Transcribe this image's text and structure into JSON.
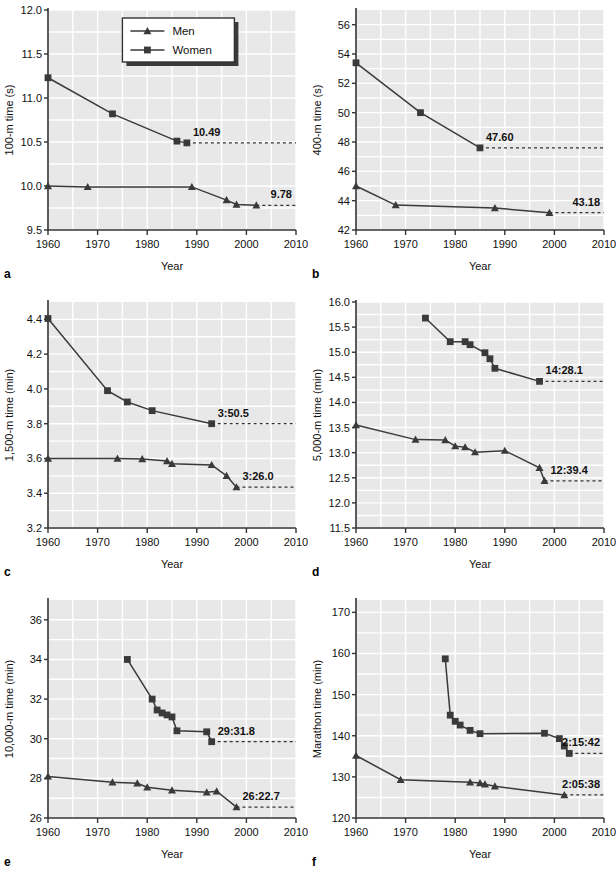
{
  "figure": {
    "panel_letters": [
      "a",
      "b",
      "c",
      "d",
      "e",
      "f"
    ],
    "legend": {
      "men_label": "Men",
      "women_label": "Women"
    },
    "xlabel": "Year",
    "xlim": [
      1960,
      2010
    ],
    "xticks": [
      1960,
      1970,
      1980,
      1990,
      2000,
      2010
    ],
    "colors": {
      "plot_bg": "#e8e8e8",
      "grid": "#ffffff",
      "axis": "#333333",
      "men": "#3a3a3a",
      "women": "#3a3a3a",
      "page_bg": "#ffffff"
    }
  },
  "chart_data": [
    {
      "type": "line",
      "panel": "a",
      "title": "",
      "xlabel": "Year",
      "ylabel": "100-m time (s)",
      "xlim": [
        1960,
        2010
      ],
      "ylim": [
        9.5,
        12.0
      ],
      "xticks": [
        1960,
        1970,
        1980,
        1990,
        2000,
        2010
      ],
      "yticks": [
        9.5,
        10.0,
        10.5,
        11.0,
        11.5,
        12.0
      ],
      "ytick_labels": [
        "9.5",
        "10.0",
        "10.5",
        "11.0",
        "11.5",
        "12.0"
      ],
      "grid": true,
      "legend": "top-center",
      "annotations": [
        {
          "text": "10.49",
          "x": 1988,
          "y": 10.49,
          "series": "Women"
        },
        {
          "text": "9.78",
          "x": 2002,
          "y": 9.78,
          "series": "Men"
        }
      ],
      "series": [
        {
          "name": "Men",
          "marker": "triangle",
          "x": [
            1960,
            1968,
            1989,
            1996,
            1998,
            2002
          ],
          "values": [
            10.0,
            9.99,
            9.99,
            9.84,
            9.79,
            9.78
          ]
        },
        {
          "name": "Women",
          "marker": "square",
          "x": [
            1960,
            1973,
            1986,
            1988
          ],
          "values": [
            11.23,
            10.82,
            10.51,
            10.49
          ]
        }
      ]
    },
    {
      "type": "line",
      "panel": "b",
      "title": "",
      "xlabel": "Year",
      "ylabel": "400-m time (s)",
      "xlim": [
        1960,
        2010
      ],
      "ylim": [
        42,
        57
      ],
      "xticks": [
        1960,
        1970,
        1980,
        1990,
        2000,
        2010
      ],
      "yticks": [
        42,
        44,
        46,
        48,
        50,
        52,
        54,
        56
      ],
      "ytick_labels": [
        "42",
        "44",
        "46",
        "48",
        "50",
        "52",
        "54",
        "56"
      ],
      "grid": true,
      "annotations": [
        {
          "text": "47.60",
          "x": 1985,
          "y": 47.6,
          "series": "Women"
        },
        {
          "text": "43.18",
          "x": 1999,
          "y": 43.18,
          "series": "Men"
        }
      ],
      "series": [
        {
          "name": "Men",
          "marker": "triangle",
          "x": [
            1960,
            1968,
            1988,
            1999
          ],
          "values": [
            45.0,
            43.7,
            43.5,
            43.18
          ]
        },
        {
          "name": "Women",
          "marker": "square",
          "x": [
            1960,
            1973,
            1985
          ],
          "values": [
            53.4,
            50.0,
            47.6
          ]
        }
      ]
    },
    {
      "type": "line",
      "panel": "c",
      "title": "",
      "xlabel": "Year",
      "ylabel": "1,500-m time (min)",
      "xlim": [
        1960,
        2010
      ],
      "ylim": [
        3.2,
        4.5
      ],
      "xticks": [
        1960,
        1970,
        1980,
        1990,
        2000,
        2010
      ],
      "yticks": [
        3.2,
        3.4,
        3.6,
        3.8,
        4.0,
        4.2,
        4.4
      ],
      "ytick_labels": [
        "3.2",
        "3.4",
        "3.6",
        "3.8",
        "4.0",
        "4.2",
        "4.4"
      ],
      "grid": true,
      "annotations": [
        {
          "text": "3:50.5",
          "x": 1993,
          "y": 3.8,
          "series": "Women"
        },
        {
          "text": "3:26.0",
          "x": 1998,
          "y": 3.435,
          "series": "Men"
        }
      ],
      "series": [
        {
          "name": "Men",
          "marker": "triangle",
          "x": [
            1960,
            1974,
            1979,
            1984,
            1985,
            1993,
            1996,
            1998
          ],
          "values": [
            3.6,
            3.6,
            3.597,
            3.585,
            3.57,
            3.563,
            3.5,
            3.435
          ]
        },
        {
          "name": "Women",
          "marker": "square",
          "x": [
            1960,
            1972,
            1976,
            1981,
            1993
          ],
          "values": [
            4.405,
            3.99,
            3.925,
            3.875,
            3.8
          ]
        }
      ]
    },
    {
      "type": "line",
      "panel": "d",
      "title": "",
      "xlabel": "Year",
      "ylabel": "5,000-m time (min)",
      "xlim": [
        1960,
        2010
      ],
      "ylim": [
        11.5,
        16.0
      ],
      "xticks": [
        1960,
        1970,
        1980,
        1990,
        2000,
        2010
      ],
      "yticks": [
        11.5,
        12.0,
        12.5,
        13.0,
        13.5,
        14.0,
        14.5,
        15.0,
        15.5,
        16.0
      ],
      "ytick_labels": [
        "11.5",
        "12.0",
        "12.5",
        "13.0",
        "13.5",
        "14.0",
        "14.5",
        "15.0",
        "15.5",
        "16.0"
      ],
      "grid": true,
      "annotations": [
        {
          "text": "14:28.1",
          "x": 1997,
          "y": 14.42,
          "series": "Women"
        },
        {
          "text": "12:39.4",
          "x": 1998,
          "y": 12.44,
          "series": "Men"
        }
      ],
      "series": [
        {
          "name": "Men",
          "marker": "triangle",
          "x": [
            1960,
            1972,
            1978,
            1980,
            1982,
            1984,
            1990,
            1997,
            1998
          ],
          "values": [
            13.55,
            13.26,
            13.25,
            13.13,
            13.11,
            13.01,
            13.04,
            12.7,
            12.44
          ]
        },
        {
          "name": "Women",
          "marker": "square",
          "x": [
            1974,
            1979,
            1982,
            1983,
            1986,
            1987,
            1988,
            1997
          ],
          "values": [
            15.68,
            15.21,
            15.21,
            15.15,
            14.99,
            14.87,
            14.68,
            14.42
          ]
        }
      ]
    },
    {
      "type": "line",
      "panel": "e",
      "title": "",
      "xlabel": "Year",
      "ylabel": "10,000-m time (min)",
      "xlim": [
        1960,
        2010
      ],
      "ylim": [
        26,
        37
      ],
      "xticks": [
        1960,
        1970,
        1980,
        1990,
        2000,
        2010
      ],
      "yticks": [
        26,
        28,
        30,
        32,
        34,
        36
      ],
      "ytick_labels": [
        "26",
        "28",
        "30",
        "32",
        "34",
        "36"
      ],
      "grid": true,
      "annotations": [
        {
          "text": "29:31.8",
          "x": 1993,
          "y": 29.85,
          "series": "Women"
        },
        {
          "text": "26:22.7",
          "x": 1998,
          "y": 26.55,
          "series": "Men"
        }
      ],
      "series": [
        {
          "name": "Men",
          "marker": "triangle",
          "x": [
            1960,
            1973,
            1978,
            1980,
            1985,
            1992,
            1994,
            1998
          ],
          "values": [
            28.1,
            27.8,
            27.75,
            27.55,
            27.4,
            27.3,
            27.35,
            26.55
          ]
        },
        {
          "name": "Women",
          "marker": "square",
          "x": [
            1976,
            1981,
            1982,
            1983,
            1984,
            1985,
            1986,
            1992,
            1993
          ],
          "values": [
            34.0,
            32.0,
            31.45,
            31.3,
            31.2,
            31.1,
            30.4,
            30.35,
            29.85
          ]
        }
      ]
    },
    {
      "type": "line",
      "panel": "f",
      "title": "",
      "xlabel": "Year",
      "ylabel": "Marathon time (min)",
      "xlim": [
        1960,
        2010
      ],
      "ylim": [
        120,
        173
      ],
      "xticks": [
        1960,
        1970,
        1980,
        1990,
        2000,
        2010
      ],
      "yticks": [
        120,
        130,
        140,
        150,
        160,
        170
      ],
      "ytick_labels": [
        "120",
        "130",
        "140",
        "150",
        "160",
        "170"
      ],
      "grid": true,
      "annotations": [
        {
          "text": "2:15:42",
          "x": 2003,
          "y": 135.7,
          "series": "Women"
        },
        {
          "text": "2:05:38",
          "x": 2002,
          "y": 125.6,
          "series": "Men"
        }
      ],
      "series": [
        {
          "name": "Men",
          "marker": "triangle",
          "x": [
            1960,
            1969,
            1983,
            1985,
            1986,
            1988,
            2002
          ],
          "values": [
            135.2,
            129.3,
            128.7,
            128.5,
            128.2,
            127.7,
            125.6
          ]
        },
        {
          "name": "Women",
          "marker": "square",
          "x": [
            1978,
            1979,
            1980,
            1981,
            1983,
            1985,
            1998,
            2001,
            2002,
            2003
          ],
          "values": [
            158.7,
            145.0,
            143.5,
            142.6,
            141.3,
            140.5,
            140.6,
            139.3,
            137.5,
            135.7
          ]
        }
      ]
    }
  ]
}
